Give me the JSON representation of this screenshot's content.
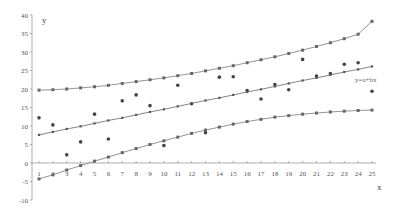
{
  "chart_data": {
    "type": "scatter",
    "title": "",
    "xlabel": "x",
    "ylabel": "y",
    "xlim": [
      1,
      25
    ],
    "ylim": [
      -10,
      40
    ],
    "x_ticks": [
      1,
      2,
      3,
      4,
      5,
      6,
      7,
      8,
      9,
      10,
      11,
      12,
      13,
      14,
      15,
      16,
      17,
      18,
      19,
      20,
      21,
      22,
      23,
      24,
      25
    ],
    "y_ticks": [
      -10,
      -5,
      0,
      5,
      10,
      15,
      20,
      25,
      30,
      35,
      40
    ],
    "grid": false,
    "legend": null,
    "annotations": [
      {
        "text": "y=a+bx",
        "x": 24.6,
        "y": 24.0
      }
    ],
    "x": [
      1,
      2,
      3,
      4,
      5,
      6,
      7,
      8,
      9,
      10,
      11,
      12,
      13,
      14,
      15,
      16,
      17,
      18,
      19,
      20,
      21,
      22,
      23,
      24,
      25
    ],
    "series": [
      {
        "name": "observations",
        "kind": "scatter",
        "color": "#444444",
        "values": [
          12.2,
          10.3,
          2.2,
          5.7,
          13.2,
          6.5,
          16.8,
          18.4,
          15.5,
          4.7,
          21.0,
          16.0,
          8.2,
          23.2,
          23.3,
          19.6,
          17.3,
          21.2,
          19.8,
          28.0,
          23.5,
          24.2,
          26.7,
          27.1,
          19.4
        ]
      },
      {
        "name": "y=a+bx (fitted line)",
        "kind": "line",
        "color": "#777777",
        "values": [
          7.6,
          8.4,
          9.2,
          9.9,
          10.7,
          11.5,
          12.2,
          13.0,
          13.8,
          14.5,
          15.3,
          16.1,
          16.9,
          17.6,
          18.4,
          19.2,
          19.9,
          20.7,
          21.5,
          22.3,
          23.0,
          23.8,
          24.6,
          25.3,
          26.1
        ]
      },
      {
        "name": "upper band",
        "kind": "line",
        "color": "#888888",
        "values": [
          19.7,
          19.8,
          20.0,
          20.3,
          20.6,
          21.0,
          21.5,
          22.0,
          22.5,
          23.0,
          23.6,
          24.2,
          24.9,
          25.6,
          26.3,
          27.1,
          27.9,
          28.7,
          29.6,
          30.5,
          31.5,
          32.5,
          33.6,
          34.8,
          38.3
        ]
      },
      {
        "name": "lower band",
        "kind": "line",
        "color": "#888888",
        "values": [
          -4.3,
          -3.2,
          -1.9,
          -0.7,
          0.5,
          1.6,
          2.8,
          3.9,
          5.0,
          6.0,
          7.0,
          8.0,
          8.9,
          9.7,
          10.5,
          11.2,
          11.8,
          12.4,
          12.8,
          13.2,
          13.5,
          13.8,
          14.0,
          14.2,
          14.3
        ]
      }
    ]
  }
}
